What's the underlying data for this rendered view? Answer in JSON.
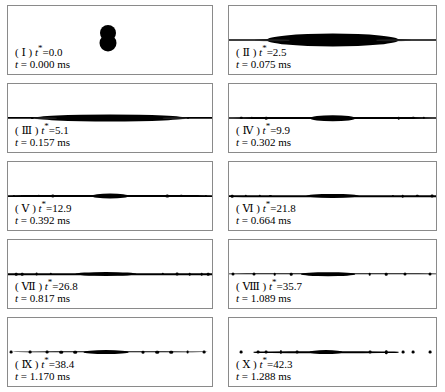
{
  "figure": {
    "type": "image-sequence",
    "width": 445,
    "height": 392,
    "background_color": "#ffffff",
    "panel_border_color": "#8a8a8a",
    "fluid_color": "#000000",
    "columns": 2,
    "rows": 5,
    "time_unit": "ms",
    "dimensionless_time_symbol": "t*"
  },
  "panels": [
    {
      "id": "panel-1",
      "numeral": "Ⅰ",
      "t_star_label": "t*=0.0",
      "t_star_value": 0.0,
      "time_label": "t = 0.000 ms",
      "time_value": 0.0,
      "caption_prefix": "(",
      "caption_suffix": ")",
      "stage": "two-droplets-contact",
      "structures": [
        {
          "kind": "blob",
          "cx": 49.0,
          "cy": 40.0,
          "w": 16,
          "h": 16
        },
        {
          "kind": "blob",
          "cx": 49.0,
          "cy": 54.0,
          "w": 17,
          "h": 17
        }
      ]
    },
    {
      "id": "panel-2",
      "numeral": "Ⅱ",
      "t_star_label": "t*=2.5",
      "t_star_value": 2.5,
      "time_label": "t = 0.075 ms",
      "time_value": 0.075,
      "caption_prefix": "(",
      "caption_suffix": ")",
      "stage": "lens-flattening",
      "structures": [
        {
          "kind": "lens",
          "cx": 50.0,
          "cy": 50.0,
          "w": 64,
          "h": 13
        },
        {
          "kind": "ligament",
          "cx": 50.0,
          "cy": 50.0,
          "w": 118,
          "h": 2
        },
        {
          "kind": "haze",
          "cx": 21.0,
          "cy": 50.0,
          "w": 16,
          "h": 1.5
        },
        {
          "kind": "haze",
          "cx": 79.0,
          "cy": 50.0,
          "w": 16,
          "h": 1.5
        }
      ]
    },
    {
      "id": "panel-3",
      "numeral": "Ⅲ",
      "t_star_label": "t*=5.1",
      "t_star_value": 5.1,
      "time_label": "t = 0.157 ms",
      "time_value": 0.157,
      "caption_prefix": "(",
      "caption_suffix": ")",
      "stage": "thin-sheet-expansion",
      "structures": [
        {
          "kind": "lens",
          "cx": 50.0,
          "cy": 50.0,
          "w": 74,
          "h": 7
        },
        {
          "kind": "ligament",
          "cx": 50.0,
          "cy": 50.0,
          "w": 142,
          "h": 2.2
        },
        {
          "kind": "frag",
          "cx": 12.0,
          "cy": 50.0,
          "w": 2.2,
          "h": 2.2
        },
        {
          "kind": "frag",
          "cx": 88.0,
          "cy": 50.0,
          "w": 2.2,
          "h": 2.2
        },
        {
          "kind": "haze",
          "cx": 18.0,
          "cy": 50.0,
          "w": 12,
          "h": 1.6
        },
        {
          "kind": "haze",
          "cx": 82.0,
          "cy": 50.0,
          "w": 12,
          "h": 1.6
        }
      ]
    },
    {
      "id": "panel-4",
      "numeral": "Ⅳ",
      "t_star_label": "t*=9.9",
      "t_star_value": 9.9,
      "time_label": "t = 0.302 ms",
      "time_value": 0.302,
      "caption_prefix": "(",
      "caption_suffix": ")",
      "stage": "ligament-stretching",
      "structures": [
        {
          "kind": "lens",
          "cx": 50.0,
          "cy": 50.0,
          "w": 22,
          "h": 5.5
        },
        {
          "kind": "ligament",
          "cx": 50.0,
          "cy": 50.0,
          "w": 150,
          "h": 2.0
        },
        {
          "kind": "frag",
          "cx": 6.0,
          "cy": 50.0,
          "w": 2.4,
          "h": 2.4
        },
        {
          "kind": "frag",
          "cx": 11.0,
          "cy": 50.0,
          "w": 2.4,
          "h": 2.4
        },
        {
          "kind": "frag",
          "cx": 18.0,
          "cy": 50.0,
          "w": 2.6,
          "h": 2.6
        },
        {
          "kind": "frag",
          "cx": 82.0,
          "cy": 50.0,
          "w": 2.6,
          "h": 2.6
        },
        {
          "kind": "frag",
          "cx": 89.0,
          "cy": 50.0,
          "w": 2.4,
          "h": 2.4
        },
        {
          "kind": "frag",
          "cx": 94.0,
          "cy": 50.0,
          "w": 2.4,
          "h": 2.4
        }
      ]
    },
    {
      "id": "panel-5",
      "numeral": "Ⅴ",
      "t_star_label": "t*=12.9",
      "t_star_value": 12.9,
      "time_label": "t = 0.392 ms",
      "time_value": 0.392,
      "caption_prefix": "(",
      "caption_suffix": ")",
      "stage": "ligament-with-end-beads",
      "structures": [
        {
          "kind": "lens",
          "cx": 50.0,
          "cy": 50.0,
          "w": 18,
          "h": 5.0
        },
        {
          "kind": "ligament",
          "cx": 50.0,
          "cy": 50.0,
          "w": 164,
          "h": 1.9
        },
        {
          "kind": "frag",
          "cx": 3.0,
          "cy": 50.0,
          "w": 2.2,
          "h": 2.2
        },
        {
          "kind": "frag",
          "cx": 7.0,
          "cy": 50.0,
          "w": 2.2,
          "h": 2.2
        },
        {
          "kind": "frag",
          "cx": 15.0,
          "cy": 50.0,
          "w": 2.4,
          "h": 2.4
        },
        {
          "kind": "frag",
          "cx": 22.0,
          "cy": 50.0,
          "w": 3.4,
          "h": 3.0
        },
        {
          "kind": "frag",
          "cx": 78.0,
          "cy": 50.0,
          "w": 3.4,
          "h": 3.0
        },
        {
          "kind": "frag",
          "cx": 85.0,
          "cy": 50.0,
          "w": 2.4,
          "h": 2.4
        },
        {
          "kind": "frag",
          "cx": 93.0,
          "cy": 50.0,
          "w": 2.2,
          "h": 2.2
        },
        {
          "kind": "frag",
          "cx": 97.0,
          "cy": 50.0,
          "w": 2.2,
          "h": 2.2
        }
      ]
    },
    {
      "id": "panel-6",
      "numeral": "Ⅵ",
      "t_star_label": "t*=21.8",
      "t_star_value": 21.8,
      "time_label": "t = 0.664 ms",
      "time_value": 0.664,
      "caption_prefix": "(",
      "caption_suffix": ")",
      "stage": "early-breakup",
      "structures": [
        {
          "kind": "lens",
          "cx": 50.0,
          "cy": 50.0,
          "w": 26,
          "h": 4.2
        },
        {
          "kind": "ligament",
          "cx": 50.0,
          "cy": 50.0,
          "w": 172,
          "h": 1.6
        },
        {
          "kind": "frag",
          "cx": 1.5,
          "cy": 50.0,
          "w": 2.6,
          "h": 2.6
        },
        {
          "kind": "frag",
          "cx": 8.0,
          "cy": 50.0,
          "w": 2.4,
          "h": 2.4
        },
        {
          "kind": "frag",
          "cx": 15.0,
          "cy": 50.0,
          "w": 2.4,
          "h": 2.4
        },
        {
          "kind": "frag",
          "cx": 20.0,
          "cy": 50.0,
          "w": 2.2,
          "h": 2.2
        },
        {
          "kind": "frag",
          "cx": 79.0,
          "cy": 50.0,
          "w": 2.2,
          "h": 2.2
        },
        {
          "kind": "frag",
          "cx": 84.0,
          "cy": 50.0,
          "w": 2.6,
          "h": 2.6
        },
        {
          "kind": "frag",
          "cx": 91.0,
          "cy": 50.0,
          "w": 2.4,
          "h": 2.4
        },
        {
          "kind": "frag",
          "cx": 98.0,
          "cy": 50.0,
          "w": 2.8,
          "h": 2.8
        }
      ]
    },
    {
      "id": "panel-7",
      "numeral": "Ⅶ",
      "t_star_label": "t*=26.8",
      "t_star_value": 26.8,
      "time_label": "t = 0.817 ms",
      "time_value": 0.817,
      "caption_prefix": "(",
      "caption_suffix": ")",
      "stage": "fragmenting",
      "structures": [
        {
          "kind": "lens",
          "cx": 48.0,
          "cy": 50.0,
          "w": 30,
          "h": 4.0
        },
        {
          "kind": "ligament",
          "cx": 50.0,
          "cy": 50.0,
          "w": 160,
          "h": 1.5
        },
        {
          "kind": "frag",
          "cx": 4.0,
          "cy": 50.0,
          "w": 2.6,
          "h": 2.6
        },
        {
          "kind": "frag",
          "cx": 7.0,
          "cy": 50.0,
          "w": 2.6,
          "h": 2.6
        },
        {
          "kind": "frag",
          "cx": 14.0,
          "cy": 50.0,
          "w": 2.8,
          "h": 2.8
        },
        {
          "kind": "frag",
          "cx": 21.0,
          "cy": 50.0,
          "w": 2.4,
          "h": 2.4
        },
        {
          "kind": "frag",
          "cx": 76.0,
          "cy": 50.0,
          "w": 2.4,
          "h": 2.4
        },
        {
          "kind": "frag",
          "cx": 83.0,
          "cy": 50.0,
          "w": 2.8,
          "h": 2.8
        },
        {
          "kind": "frag",
          "cx": 89.0,
          "cy": 50.0,
          "w": 2.6,
          "h": 2.6
        },
        {
          "kind": "frag",
          "cx": 95.0,
          "cy": 50.0,
          "w": 2.6,
          "h": 2.6
        },
        {
          "kind": "frag",
          "cx": 98.0,
          "cy": 50.0,
          "w": 2.6,
          "h": 2.6
        }
      ]
    },
    {
      "id": "panel-8",
      "numeral": "Ⅷ",
      "t_star_label": "t*=35.7",
      "t_star_value": 35.7,
      "time_label": "t = 1.089 ms",
      "time_value": 1.089,
      "caption_prefix": "(",
      "caption_suffix": ")",
      "stage": "satellite-droplets",
      "structures": [
        {
          "kind": "lens",
          "cx": 48.0,
          "cy": 50.0,
          "w": 26,
          "h": 3.6
        },
        {
          "kind": "ligament",
          "cx": 50.0,
          "cy": 50.0,
          "w": 150,
          "h": 1.4
        },
        {
          "kind": "frag",
          "cx": 2.0,
          "cy": 50.0,
          "w": 3.0,
          "h": 3.0
        },
        {
          "kind": "frag",
          "cx": 12.0,
          "cy": 50.0,
          "w": 3.0,
          "h": 3.0
        },
        {
          "kind": "frag",
          "cx": 22.0,
          "cy": 50.0,
          "w": 2.6,
          "h": 2.6
        },
        {
          "kind": "frag",
          "cx": 30.0,
          "cy": 50.0,
          "w": 2.6,
          "h": 2.6
        },
        {
          "kind": "frag",
          "cx": 68.0,
          "cy": 50.0,
          "w": 2.6,
          "h": 2.6
        },
        {
          "kind": "frag",
          "cx": 76.0,
          "cy": 50.0,
          "w": 2.6,
          "h": 2.6
        },
        {
          "kind": "frag",
          "cx": 85.0,
          "cy": 50.0,
          "w": 3.0,
          "h": 3.0
        },
        {
          "kind": "frag",
          "cx": 97.0,
          "cy": 50.0,
          "w": 3.0,
          "h": 3.0
        }
      ]
    },
    {
      "id": "panel-9",
      "numeral": "Ⅸ",
      "t_star_label": "t*=38.4",
      "t_star_value": 38.4,
      "time_label": "t = 1.170 ms",
      "time_value": 1.17,
      "caption_prefix": "(",
      "caption_suffix": ")",
      "stage": "dispersed-droplets",
      "structures": [
        {
          "kind": "lens",
          "cx": 48.0,
          "cy": 50.0,
          "w": 22,
          "h": 3.8
        },
        {
          "kind": "ligament",
          "cx": 50.0,
          "cy": 50.0,
          "w": 96,
          "h": 1.4
        },
        {
          "kind": "frag",
          "cx": 1.5,
          "cy": 50.0,
          "w": 2.8,
          "h": 2.8
        },
        {
          "kind": "frag",
          "cx": 11.0,
          "cy": 50.0,
          "w": 2.8,
          "h": 2.8
        },
        {
          "kind": "frag",
          "cx": 19.0,
          "cy": 50.0,
          "w": 2.8,
          "h": 2.8
        },
        {
          "kind": "frag",
          "cx": 26.0,
          "cy": 50.0,
          "w": 3.6,
          "h": 2.6
        },
        {
          "kind": "frag",
          "cx": 33.0,
          "cy": 50.0,
          "w": 3.6,
          "h": 2.6
        },
        {
          "kind": "frag",
          "cx": 66.0,
          "cy": 50.0,
          "w": 3.0,
          "h": 2.6
        },
        {
          "kind": "frag",
          "cx": 73.0,
          "cy": 50.0,
          "w": 3.6,
          "h": 2.6
        },
        {
          "kind": "frag",
          "cx": 80.0,
          "cy": 50.0,
          "w": 3.6,
          "h": 2.6
        },
        {
          "kind": "frag",
          "cx": 88.0,
          "cy": 50.0,
          "w": 2.8,
          "h": 2.8
        },
        {
          "kind": "frag",
          "cx": 96.0,
          "cy": 50.0,
          "w": 2.8,
          "h": 2.8
        }
      ]
    },
    {
      "id": "panel-10",
      "numeral": "Ⅹ",
      "t_star_label": "t*=42.3",
      "t_star_value": 42.3,
      "time_label": "t = 1.288 ms",
      "time_value": 1.288,
      "caption_prefix": "(",
      "caption_suffix": ")",
      "stage": "fully-fragmented",
      "structures": [
        {
          "kind": "lens",
          "cx": 47.0,
          "cy": 50.0,
          "w": 16,
          "h": 3.8
        },
        {
          "kind": "ligament",
          "cx": 47.0,
          "cy": 50.0,
          "w": 70,
          "h": 1.5
        },
        {
          "kind": "frag",
          "cx": 6.0,
          "cy": 50.0,
          "w": 2.8,
          "h": 2.8
        },
        {
          "kind": "frag",
          "cx": 14.0,
          "cy": 50.0,
          "w": 2.8,
          "h": 2.8
        },
        {
          "kind": "frag",
          "cx": 18.0,
          "cy": 50.0,
          "w": 2.8,
          "h": 2.8
        },
        {
          "kind": "frag",
          "cx": 25.0,
          "cy": 50.0,
          "w": 2.2,
          "h": 4.0
        },
        {
          "kind": "frag",
          "cx": 33.0,
          "cy": 50.0,
          "w": 2.8,
          "h": 2.8
        },
        {
          "kind": "frag",
          "cx": 68.0,
          "cy": 50.0,
          "w": 2.8,
          "h": 2.8
        },
        {
          "kind": "frag",
          "cx": 76.0,
          "cy": 50.0,
          "w": 2.4,
          "h": 3.6
        },
        {
          "kind": "frag",
          "cx": 84.0,
          "cy": 50.0,
          "w": 2.8,
          "h": 2.8
        },
        {
          "kind": "frag",
          "cx": 89.0,
          "cy": 50.0,
          "w": 2.8,
          "h": 2.8
        },
        {
          "kind": "frag",
          "cx": 97.0,
          "cy": 50.0,
          "w": 2.8,
          "h": 2.8
        }
      ]
    }
  ]
}
